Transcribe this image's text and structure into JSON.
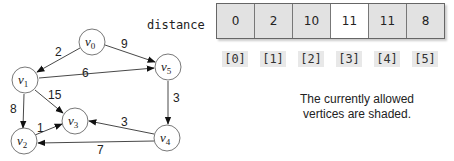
{
  "graph": {
    "nodes": [
      {
        "id": "v0",
        "label": "v",
        "sub": "0",
        "x": 92,
        "y": 42
      },
      {
        "id": "v1",
        "label": "v",
        "sub": "1",
        "x": 25,
        "y": 80
      },
      {
        "id": "v2",
        "label": "v",
        "sub": "2",
        "x": 24,
        "y": 141
      },
      {
        "id": "v3",
        "label": "v",
        "sub": "3",
        "x": 75,
        "y": 121
      },
      {
        "id": "v4",
        "label": "v",
        "sub": "4",
        "x": 167,
        "y": 138
      },
      {
        "id": "v5",
        "label": "v",
        "sub": "5",
        "x": 168,
        "y": 67
      }
    ],
    "edges": [
      {
        "from": "v0",
        "to": "v1",
        "weight": "2"
      },
      {
        "from": "v0",
        "to": "v5",
        "weight": "9"
      },
      {
        "from": "v1",
        "to": "v5",
        "weight": "6"
      },
      {
        "from": "v1",
        "to": "v3",
        "weight": "15"
      },
      {
        "from": "v1",
        "to": "v2",
        "weight": "8"
      },
      {
        "from": "v2",
        "to": "v3",
        "weight": "1"
      },
      {
        "from": "v5",
        "to": "v4",
        "weight": "3"
      },
      {
        "from": "v4",
        "to": "v3",
        "weight": "3"
      },
      {
        "from": "v4",
        "to": "v2",
        "weight": "7"
      }
    ]
  },
  "distance": {
    "label": "distance",
    "values": [
      "0",
      "2",
      "10",
      "11",
      "11",
      "8"
    ],
    "indices": [
      "[0]",
      "[1]",
      "[2]",
      "[3]",
      "[4]",
      "[5]"
    ],
    "shaded": [
      true,
      true,
      true,
      false,
      true,
      true
    ]
  },
  "note": {
    "line1": "The currently allowed",
    "line2": "vertices are shaded."
  }
}
